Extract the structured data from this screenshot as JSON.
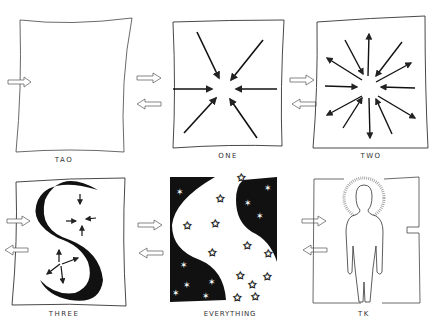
{
  "diagram": {
    "stroke_color": "#222222",
    "background": "#ffffff",
    "panels": [
      {
        "label": "TAO",
        "description": "empty square"
      },
      {
        "label": "ONE",
        "description": "eight arrows converging to center"
      },
      {
        "label": "TWO",
        "description": "arrows converging and diverging from center"
      },
      {
        "label": "THREE",
        "description": "S-shaped ribbon with converging and diverging arrows"
      },
      {
        "label": "EVERYTHING",
        "description": "black and white halves with stars"
      },
      {
        "label": "TK",
        "description": "human figure with halo"
      }
    ],
    "transitions": [
      {
        "from": "TAO",
        "to": "ONE"
      },
      {
        "from": "ONE",
        "to": "TWO"
      },
      {
        "from": "THREE",
        "to": "EVERYTHING"
      },
      {
        "from": "EVERYTHING",
        "to": "TK"
      }
    ]
  }
}
